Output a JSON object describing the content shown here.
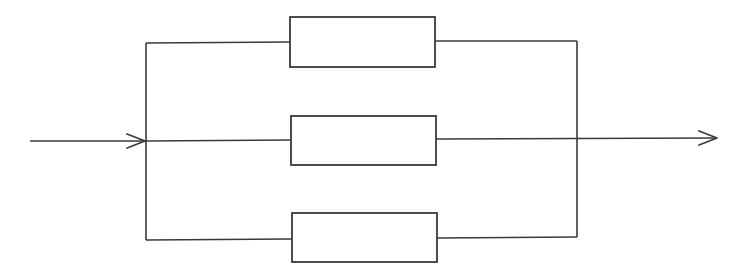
{
  "diagram": {
    "type": "parallel-block-diagram",
    "colors": {
      "line": "#3a3a3a",
      "background": "#ffffff",
      "block_fill": "#ffffff"
    },
    "input": {
      "label": "",
      "icon": "arrow-right-icon"
    },
    "output": {
      "label": "",
      "icon": "arrow-right-icon"
    },
    "blocks": [
      {
        "id": "block-top",
        "label": ""
      },
      {
        "id": "block-middle",
        "label": ""
      },
      {
        "id": "block-bottom",
        "label": ""
      }
    ],
    "connections": [
      {
        "from": "input",
        "to": "left-bus"
      },
      {
        "from": "left-bus",
        "to": "block-top"
      },
      {
        "from": "left-bus",
        "to": "block-middle"
      },
      {
        "from": "left-bus",
        "to": "block-bottom"
      },
      {
        "from": "block-top",
        "to": "right-bus"
      },
      {
        "from": "block-middle",
        "to": "right-bus"
      },
      {
        "from": "block-bottom",
        "to": "right-bus"
      },
      {
        "from": "right-bus",
        "to": "output"
      }
    ]
  }
}
